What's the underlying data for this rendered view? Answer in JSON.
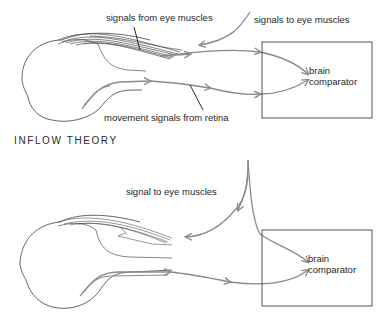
{
  "figure": {
    "top_panel": {
      "labels": {
        "from_muscles": "signals from eye muscles",
        "to_muscles": "signals to eye muscles",
        "retina": "movement signals from retina",
        "brain_line1": "brain",
        "brain_line2": "comparator"
      },
      "title": "INFLOW THEORY"
    },
    "bottom_panel": {
      "labels": {
        "to_muscles": "signal to eye muscles",
        "brain_line1": "brain",
        "brain_line2": "comparator"
      }
    },
    "colors": {
      "nerve": "#8a8a8a",
      "outline": "#555555",
      "leader": "#111111",
      "box": "#444444"
    }
  }
}
